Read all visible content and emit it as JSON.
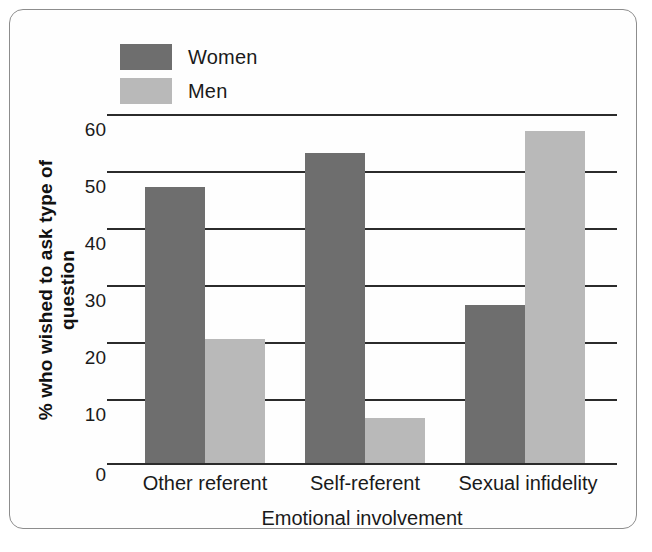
{
  "chart_data": {
    "type": "bar",
    "title": "",
    "subtitle": "",
    "xlabel": "Emotional involvement",
    "ylabel": "% who wished to ask type of question",
    "categories": [
      "Other referent",
      "Self-referent",
      "Sexual infidelity"
    ],
    "series": [
      {
        "name": "Women",
        "values": [
          49,
          55,
          28
        ],
        "color": "#6e6e6e"
      },
      {
        "name": "Men",
        "values": [
          22,
          8,
          59
        ],
        "color": "#b9b9b9"
      }
    ],
    "ylim": [
      0,
      62
    ],
    "yticks": [
      0,
      10,
      20,
      30,
      40,
      50,
      60
    ],
    "ytick_labels": [
      "0",
      "10",
      "20",
      "30",
      "40",
      "50",
      "60"
    ],
    "grid": true,
    "grid_orientation": "horizontal",
    "legend_position": "top-left",
    "annotations": []
  },
  "legend": {
    "items": [
      {
        "label": "Women",
        "color": "#6e6e6e"
      },
      {
        "label": "Men",
        "color": "#b9b9b9"
      }
    ]
  },
  "axes": {
    "y_title": "% who wished to ask type of question",
    "x_title": "Emotional involvement",
    "y_tick_0": "0",
    "y_tick_10": "10",
    "y_tick_20": "20",
    "y_tick_30": "30",
    "y_tick_40": "40",
    "y_tick_50": "50",
    "y_tick_60": "60",
    "x_tick_1": "Other referent",
    "x_tick_2": "Self-referent",
    "x_tick_3": "Sexual infidelity"
  },
  "style": {
    "background": "#fefefe",
    "frame_border": "#8d8d8d",
    "gridline_color": "#2b2b2b",
    "text_color": "#1a1a1a"
  }
}
